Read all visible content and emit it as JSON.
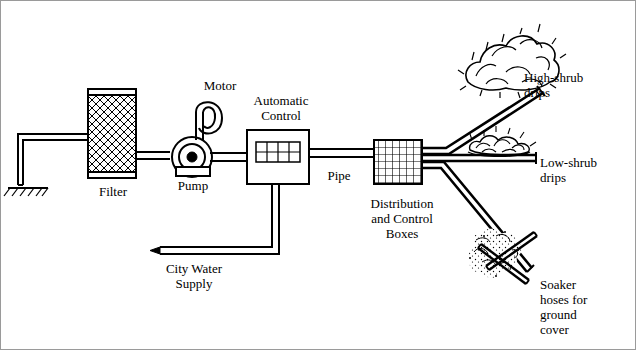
{
  "diagram": {
    "labels": [
      {
        "id": "motor",
        "text": "Motor",
        "x": 190,
        "y": 78,
        "w": 60,
        "align": "center"
      },
      {
        "id": "automatic",
        "text": "Automatic\nControl",
        "x": 243,
        "y": 93,
        "w": 76,
        "align": "center"
      },
      {
        "id": "filter",
        "text": "Filter",
        "x": 85,
        "y": 184,
        "w": 56,
        "align": "center"
      },
      {
        "id": "pump",
        "text": "Pump",
        "x": 168,
        "y": 178,
        "w": 50,
        "align": "center"
      },
      {
        "id": "pipe",
        "text": "Pipe",
        "x": 318,
        "y": 168,
        "w": 42,
        "align": "center"
      },
      {
        "id": "distribution",
        "text": "Distribution\nand Control\nBoxes",
        "x": 362,
        "y": 196,
        "w": 80,
        "align": "center"
      },
      {
        "id": "citywater",
        "text": "City Water\nSupply",
        "x": 158,
        "y": 261,
        "w": 72,
        "align": "center"
      },
      {
        "id": "highshrub",
        "text": "High-shrub\ndrips",
        "x": 524,
        "y": 70,
        "w": 80,
        "align": "left"
      },
      {
        "id": "lowshrub",
        "text": "Low-shrub\ndrips",
        "x": 540,
        "y": 155,
        "w": 80,
        "align": "left"
      },
      {
        "id": "soaker",
        "text": "Soaker\nhoses for\nground\ncover",
        "x": 540,
        "y": 277,
        "w": 74,
        "align": "left"
      }
    ],
    "components": {
      "filter": "filter-tank",
      "pump": "pump-circle",
      "motor": "motor-loop",
      "control": "automatic-control-box",
      "distribution": "distribution-grid-box",
      "ground": "ground-hatch-symbol",
      "shrub_high": "high-shrub-foliage",
      "shrub_low": "low-shrub-foliage",
      "soaker": "soaker-hose-cross"
    },
    "colors": {
      "line": "#000000",
      "background": "#ffffff",
      "frame": "#9a9a9a"
    }
  }
}
